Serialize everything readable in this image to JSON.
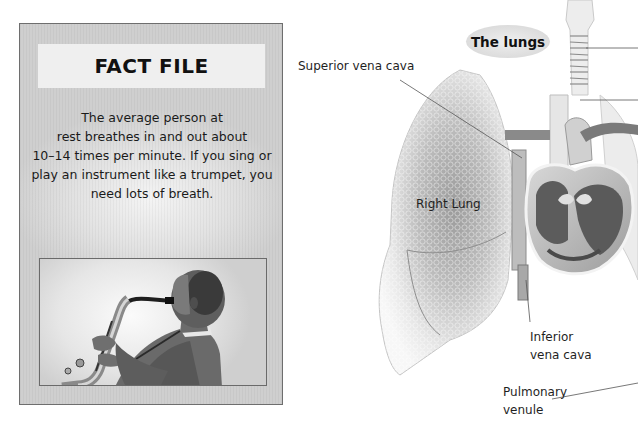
{
  "fact_file": {
    "title": "FACT FILE",
    "text_lines": [
      "The average person at",
      "rest breathes in and out about",
      "10–14 times per minute. If you sing or",
      "play an instrument like a trumpet, you",
      "need lots of breath."
    ],
    "photo": {
      "subject": "person playing saxophone",
      "icon": "saxophone-player-photo"
    }
  },
  "diagram": {
    "title": "The lungs",
    "labels": {
      "superior_vena_cava": "Superior vena cava",
      "right_lung": "Right Lung",
      "inferior_vena_cava": [
        "Inferior",
        "vena cava"
      ],
      "pulmonary_venule": [
        "Pulmonary",
        "venule"
      ]
    }
  },
  "colors": {
    "panel_bg": "#d9d9d9",
    "panel_border": "#6e6e6e",
    "title_box": "#efefef",
    "badge_bg": "#dcdcdc",
    "text": "#1a1a1a"
  }
}
